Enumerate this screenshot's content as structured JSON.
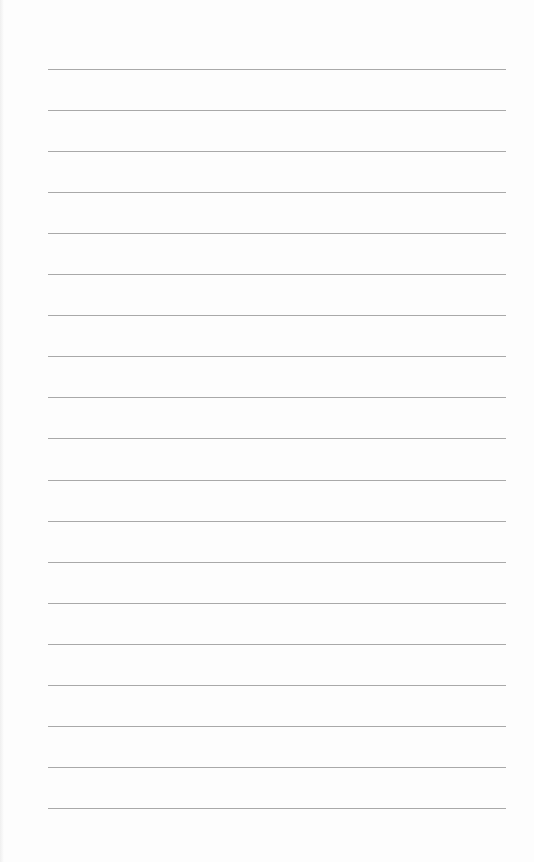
{
  "page": {
    "type": "lined-paper",
    "background_color": "#fdfdfd",
    "line_color": "#9a9a9a",
    "line_count": 19,
    "first_line_y": 69,
    "line_spacing": 41.05,
    "line_left": 48,
    "line_width": 458
  }
}
